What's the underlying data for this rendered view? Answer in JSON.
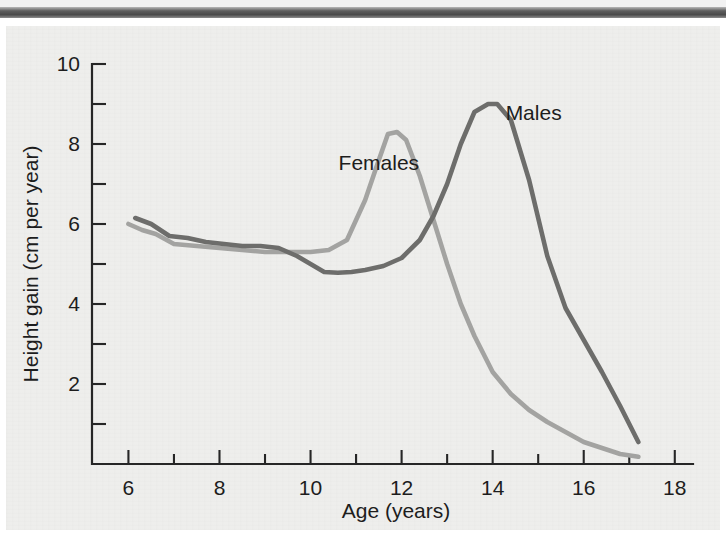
{
  "figure": {
    "background_color": "#eeeeec",
    "page_color": "#ffffff",
    "scan_band_color": "#4a4a4a"
  },
  "chart_data": {
    "type": "line",
    "title": "",
    "subtitle": "",
    "xlabel": "Age (years)",
    "ylabel": "Height gain (cm per year)",
    "xlim": [
      5.2,
      18.4
    ],
    "ylim": [
      0,
      10
    ],
    "grid": false,
    "legend_position": "inline-annotations",
    "x_ticks_major": [
      6,
      8,
      10,
      12,
      14,
      16,
      18
    ],
    "x_tick_labels": [
      "6",
      "8",
      "10",
      "12",
      "14",
      "16",
      "18"
    ],
    "x_ticks_minor": [
      7,
      9,
      11,
      13,
      15,
      17
    ],
    "y_ticks_major": [
      2,
      4,
      6,
      8,
      10
    ],
    "y_tick_labels": [
      "2",
      "4",
      "6",
      "8",
      "10"
    ],
    "y_ticks_minor": [
      1,
      3,
      5,
      7,
      9
    ],
    "series": [
      {
        "name": "Females",
        "color": "#a3a3a1",
        "label": "Females",
        "label_x": 11.5,
        "label_y": 7.35,
        "x": [
          6.0,
          6.3,
          6.6,
          7.0,
          7.5,
          8.0,
          8.5,
          9.0,
          9.5,
          10.0,
          10.4,
          10.8,
          11.2,
          11.5,
          11.7,
          11.9,
          12.1,
          12.4,
          12.7,
          13.0,
          13.3,
          13.6,
          14.0,
          14.4,
          14.8,
          15.2,
          15.6,
          16.0,
          16.4,
          16.8,
          17.2
        ],
        "y": [
          6.0,
          5.85,
          5.75,
          5.5,
          5.45,
          5.4,
          5.35,
          5.3,
          5.3,
          5.3,
          5.35,
          5.6,
          6.6,
          7.6,
          8.25,
          8.3,
          8.1,
          7.2,
          6.1,
          5.0,
          4.0,
          3.2,
          2.3,
          1.75,
          1.35,
          1.05,
          0.8,
          0.55,
          0.4,
          0.25,
          0.18
        ]
      },
      {
        "name": "Males",
        "color": "#6d6d6b",
        "label": "Males",
        "label_x": 14.9,
        "label_y": 8.6,
        "x": [
          6.15,
          6.5,
          6.9,
          7.3,
          7.7,
          8.1,
          8.5,
          8.9,
          9.3,
          9.7,
          10.0,
          10.3,
          10.6,
          10.9,
          11.2,
          11.6,
          12.0,
          12.4,
          12.7,
          13.0,
          13.3,
          13.6,
          13.9,
          14.1,
          14.4,
          14.8,
          15.2,
          15.6,
          16.0,
          16.4,
          16.8,
          17.2
        ],
        "y": [
          6.15,
          6.0,
          5.7,
          5.65,
          5.55,
          5.5,
          5.45,
          5.45,
          5.4,
          5.2,
          5.0,
          4.8,
          4.78,
          4.8,
          4.85,
          4.95,
          5.15,
          5.6,
          6.2,
          7.0,
          8.0,
          8.8,
          9.0,
          9.0,
          8.6,
          7.1,
          5.2,
          3.9,
          3.1,
          2.3,
          1.45,
          0.55
        ]
      }
    ],
    "annotations": [
      {
        "text": "Females",
        "x": 11.5,
        "y": 7.35
      },
      {
        "text": "Males",
        "x": 14.9,
        "y": 8.6
      }
    ]
  }
}
